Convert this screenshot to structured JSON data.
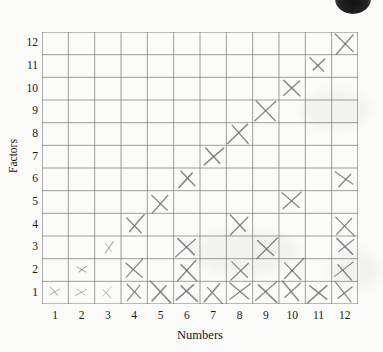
{
  "figure": {
    "background_color": "#fbfbf9",
    "ink_color": "#6f6f72",
    "grid_color": "#6b6b6b"
  },
  "axes": {
    "x_title": "Numbers",
    "y_title": "Factors",
    "x_ticks": [
      "1",
      "2",
      "3",
      "4",
      "5",
      "6",
      "7",
      "8",
      "9",
      "10",
      "11",
      "12"
    ],
    "y_ticks": [
      "1",
      "2",
      "3",
      "4",
      "5",
      "6",
      "7",
      "8",
      "9",
      "10",
      "11",
      "12"
    ]
  },
  "artifacts": {
    "scan_blob_label": "scan-artifact-blob"
  },
  "chart_data": {
    "type": "scatter",
    "title": "",
    "xlabel": "Numbers",
    "ylabel": "Factors",
    "xlim": [
      0.5,
      12.5
    ],
    "ylim": [
      0.5,
      12.5
    ],
    "grid": true,
    "legend": "none",
    "marker": "x",
    "x": [
      1,
      2,
      3,
      4,
      5,
      6,
      7,
      8,
      9,
      10,
      11,
      12,
      2,
      4,
      6,
      8,
      10,
      12,
      3,
      6,
      9,
      12,
      4,
      8,
      12,
      5,
      10,
      6,
      12,
      7,
      8,
      9,
      10,
      11,
      12
    ],
    "y": [
      1,
      1,
      1,
      1,
      1,
      1,
      1,
      1,
      1,
      1,
      1,
      1,
      2,
      2,
      2,
      2,
      2,
      2,
      3,
      3,
      3,
      3,
      4,
      4,
      4,
      5,
      5,
      6,
      6,
      7,
      8,
      9,
      10,
      11,
      12
    ],
    "points": [
      {
        "number": 1,
        "factors": [
          1
        ]
      },
      {
        "number": 2,
        "factors": [
          1,
          2
        ]
      },
      {
        "number": 3,
        "factors": [
          1,
          3
        ]
      },
      {
        "number": 4,
        "factors": [
          1,
          2,
          4
        ]
      },
      {
        "number": 5,
        "factors": [
          1,
          5
        ]
      },
      {
        "number": 6,
        "factors": [
          1,
          2,
          3,
          6
        ]
      },
      {
        "number": 7,
        "factors": [
          1,
          7
        ]
      },
      {
        "number": 8,
        "factors": [
          1,
          2,
          4,
          8
        ]
      },
      {
        "number": 9,
        "factors": [
          1,
          3,
          9
        ]
      },
      {
        "number": 10,
        "factors": [
          1,
          2,
          5,
          10
        ]
      },
      {
        "number": 11,
        "factors": [
          1,
          11
        ]
      },
      {
        "number": 12,
        "factors": [
          1,
          2,
          3,
          4,
          6,
          12
        ]
      }
    ]
  }
}
